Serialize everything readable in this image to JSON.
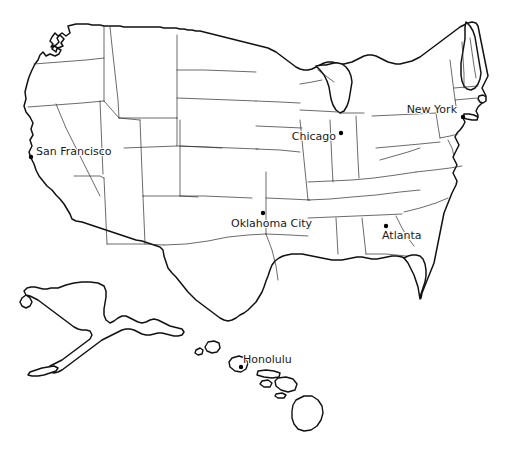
{
  "map": {
    "title": "United States map with selected cities",
    "background_color": "#ffffff",
    "outline_color": "#111111",
    "state_border_color": "#2b2b2b",
    "label_color": "#1a1a1a",
    "dot_color": "#000000",
    "regions": [
      {
        "name": "contiguous-united-states"
      },
      {
        "name": "alaska"
      },
      {
        "name": "hawaii"
      }
    ]
  },
  "cities": [
    {
      "name": "San Francisco",
      "label": "San Francisco",
      "label_x": 36,
      "label_y": 155,
      "anchor": "start",
      "dot_x": 31,
      "dot_y": 157,
      "region": "contiguous-united-states"
    },
    {
      "name": "Chicago",
      "label": "Chicago",
      "label_x": 336,
      "label_y": 140,
      "anchor": "end",
      "dot_x": 341,
      "dot_y": 133,
      "region": "contiguous-united-states"
    },
    {
      "name": "New York",
      "label": "New York",
      "label_x": 457,
      "label_y": 113,
      "anchor": "end",
      "dot_x": 463,
      "dot_y": 117,
      "region": "contiguous-united-states"
    },
    {
      "name": "Oklahoma City",
      "label": "Oklahoma City",
      "label_x": 231,
      "label_y": 227,
      "anchor": "start",
      "dot_x": 263,
      "dot_y": 213,
      "region": "contiguous-united-states"
    },
    {
      "name": "Atlanta",
      "label": "Atlanta",
      "label_x": 382,
      "label_y": 239,
      "anchor": "start",
      "dot_x": 386,
      "dot_y": 226,
      "region": "contiguous-united-states"
    },
    {
      "name": "Honolulu",
      "label": "Honolulu",
      "label_x": 243,
      "label_y": 363,
      "anchor": "start",
      "dot_x": 241,
      "dot_y": 367,
      "region": "hawaii"
    }
  ]
}
